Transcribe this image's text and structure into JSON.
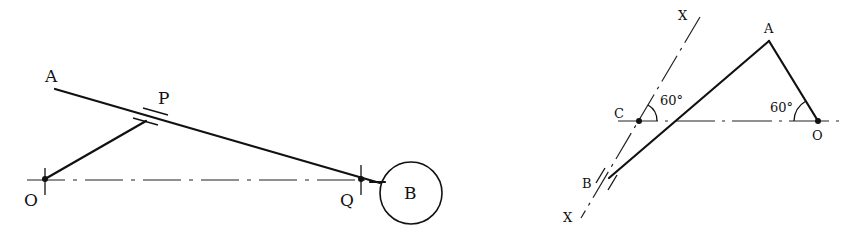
{
  "figures": [
    {
      "id": "left",
      "description": "Oscillating link OP with slider at P on rod AB, rod pivoted at Q, mass B at end",
      "labels": {
        "A": "A",
        "P": "P",
        "O": "O",
        "Q": "Q",
        "B": "B"
      }
    },
    {
      "id": "right",
      "description": "Crank OA with link AB, slider B on line XX through C at 60 degrees",
      "labels": {
        "X_top": "X",
        "X_bottom": "X",
        "A": "A",
        "C": "C",
        "O": "O",
        "B": "B",
        "angle_C": "60°",
        "angle_O": "60°"
      }
    }
  ],
  "colors": {
    "ink": "#111111",
    "background": "#ffffff"
  }
}
